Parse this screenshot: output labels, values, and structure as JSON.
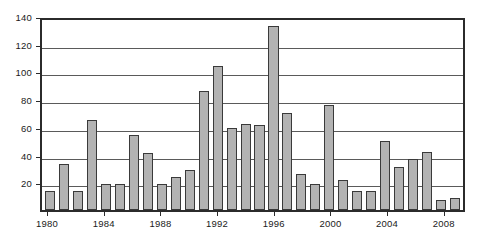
{
  "chart_data": {
    "type": "bar",
    "title": "",
    "subtitle": "",
    "xlabel": "",
    "ylabel": "",
    "ylim": [
      0,
      140
    ],
    "ytick_values": [
      0,
      20,
      40,
      60,
      80,
      100,
      120,
      140
    ],
    "ytick_labels": [
      "",
      "20",
      "40",
      "60",
      "80",
      "100",
      "120",
      "140"
    ],
    "grid": true,
    "legend": false,
    "legend_position": "none",
    "bar_fill_color": "#b3b3b3",
    "bar_edge_color": "#3a3a3a",
    "axis_color": "#2b2b2b",
    "gridline_color": "#5a5a5a",
    "background_color": "#ffffff",
    "categories": [
      "1980",
      "1981",
      "1982",
      "1983",
      "1984",
      "1985",
      "1986",
      "1987",
      "1988",
      "1989",
      "1990",
      "1991",
      "1992",
      "1993",
      "1994",
      "1995",
      "1996",
      "1997",
      "1998",
      "1999",
      "2000",
      "2001",
      "2002",
      "2003",
      "2004",
      "2005",
      "2006",
      "2007",
      "2008",
      "2009"
    ],
    "values": [
      14,
      33,
      14,
      65,
      19,
      19,
      54,
      41,
      19,
      24,
      29,
      86,
      104,
      59,
      62,
      61,
      133,
      70,
      26,
      19,
      76,
      22,
      14,
      14,
      50,
      31,
      37,
      42,
      7,
      9
    ],
    "xtick_labels": [
      "1980",
      "1984",
      "1988",
      "1992",
      "1996",
      "2000",
      "2004",
      "2008"
    ],
    "xtick_categories": [
      "1980",
      "1984",
      "1988",
      "1992",
      "1996",
      "2000",
      "2004",
      "2008"
    ]
  }
}
